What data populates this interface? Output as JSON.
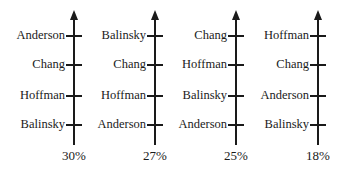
{
  "diagram": {
    "type": "preference-schedule",
    "ballots": [
      {
        "ranking": [
          "Anderson",
          "Chang",
          "Hoffman",
          "Balinsky"
        ],
        "percent": "30%"
      },
      {
        "ranking": [
          "Balinsky",
          "Chang",
          "Hoffman",
          "Anderson"
        ],
        "percent": "27%"
      },
      {
        "ranking": [
          "Chang",
          "Hoffman",
          "Balinsky",
          "Anderson"
        ],
        "percent": "25%"
      },
      {
        "ranking": [
          "Hoffman",
          "Chang",
          "Anderson",
          "Balinsky"
        ],
        "percent": "18%"
      }
    ],
    "colors": {
      "ink": "#1a1a1a",
      "background": "#ffffff"
    }
  }
}
